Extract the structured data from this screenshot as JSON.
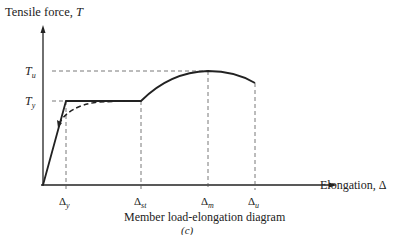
{
  "diagram": {
    "y_axis_label": "Tensile force, ",
    "y_axis_var": "T",
    "x_axis_label": "Elongation, Δ",
    "caption": "Member load-elongation diagram",
    "subcaption": "(c)",
    "y_levels": [
      {
        "name": "T",
        "sub": "u"
      },
      {
        "name": "T",
        "sub": "y"
      }
    ],
    "x_ticks": [
      {
        "name": "Δ",
        "sub": "y"
      },
      {
        "name": "Δ",
        "sub": "st"
      },
      {
        "name": "Δ",
        "sub": "m"
      },
      {
        "name": "Δ",
        "sub": "u"
      }
    ]
  }
}
